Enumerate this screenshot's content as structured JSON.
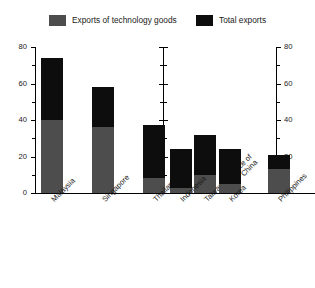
{
  "legend": {
    "items": [
      {
        "label": "Exports of technology goods",
        "color": "#4d4d4d",
        "icon": "square-swatch-icon"
      },
      {
        "label": "Total exports",
        "color": "#0d0d0d",
        "icon": "square-swatch-icon"
      }
    ]
  },
  "axis": {
    "left_ticks": [
      "80",
      "60",
      "40",
      "20",
      "0"
    ],
    "right_ticks": [
      "80",
      "60",
      "40",
      "20"
    ],
    "minor_ticks": [
      "70",
      "50",
      "30",
      "10"
    ]
  },
  "chart_data": {
    "type": "bar",
    "title": "",
    "subtitle": "",
    "xlabel": "",
    "ylabel": "",
    "ylim": [
      0,
      80
    ],
    "ytick_step": 20,
    "yminor_step": 10,
    "grid": false,
    "legend_position": "top",
    "stacked": true,
    "panels": [
      {
        "name": "left-panel",
        "categories": [
          "Malaysia",
          "Singapore",
          "Thailand",
          "Taiwan Province of China"
        ],
        "series": [
          {
            "name": "Exports of technology goods",
            "color": "#4d4d4d",
            "values": [
              40,
              36,
              8,
              10
            ]
          },
          {
            "name": "Total exports",
            "color": "#0d0d0d",
            "values": [
              74,
              58,
              37,
              32
            ]
          }
        ]
      },
      {
        "name": "right-panel",
        "categories": [
          "Indonesia",
          "Korea",
          "Philippines",
          "China"
        ],
        "series": [
          {
            "name": "Exports of technology goods",
            "color": "#4d4d4d",
            "values": [
              3,
              5,
              13,
              0
            ]
          },
          {
            "name": "Total exports",
            "color": "#0d0d0d",
            "values": [
              24,
              24,
              21,
              9
            ]
          }
        ]
      }
    ]
  }
}
